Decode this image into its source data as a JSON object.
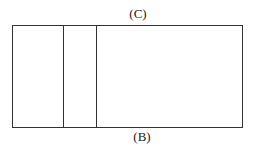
{
  "diagram": {
    "labels": {
      "top": "(C)",
      "bottom": "(B)"
    },
    "rectangle": {
      "sections": [
        {
          "name": "left",
          "width": 50
        },
        {
          "name": "middle",
          "width": 33
        },
        {
          "name": "right",
          "width": 146
        }
      ]
    },
    "colors": {
      "line": "#333333",
      "text": "#222222",
      "background": "#ffffff"
    }
  }
}
